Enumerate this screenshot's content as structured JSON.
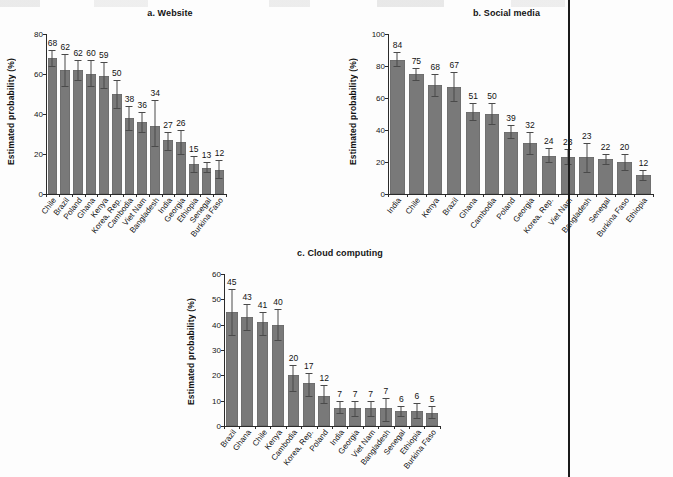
{
  "figure": {
    "ylabel": "Estimated probability (%)",
    "bar_color": "#797979",
    "error_color": "#4a4a4a",
    "axis_color": "#2b2b2b"
  },
  "chart_data": [
    {
      "type": "bar",
      "panel": "a",
      "title": "a. Website",
      "xlabel": "",
      "ylabel": "Estimated probability (%)",
      "ylim": [
        0,
        80
      ],
      "yticks": [
        0,
        20,
        40,
        60,
        80
      ],
      "grid": false,
      "legend": "none",
      "categories": [
        "Chile",
        "Brazil",
        "Poland",
        "Ghana",
        "Kenya",
        "Korea, Rep.",
        "Cambodia",
        "Viet Nam",
        "Bangladesh",
        "India",
        "Georgia",
        "Ethiopia",
        "Senegal",
        "Burkina Faso"
      ],
      "values": [
        68,
        62,
        62,
        60,
        59,
        50,
        38,
        36,
        34,
        27,
        26,
        15,
        13,
        12
      ],
      "labels": [
        "68",
        "62",
        "62",
        "60",
        "59",
        "50",
        "38",
        "36",
        "34",
        "27",
        "26",
        "15",
        "13",
        "12"
      ],
      "err_low": [
        64,
        54,
        57,
        54,
        53,
        43,
        32,
        31,
        24,
        22,
        20,
        11,
        11,
        8
      ],
      "err_high": [
        72,
        70,
        67,
        67,
        66,
        57,
        44,
        41,
        47,
        31,
        32,
        19,
        16,
        17
      ]
    },
    {
      "type": "bar",
      "panel": "b",
      "title": "b. Social media",
      "xlabel": "",
      "ylabel": "Estimated probability (%)",
      "ylim": [
        0,
        100
      ],
      "yticks": [
        0,
        20,
        40,
        60,
        80,
        100
      ],
      "grid": false,
      "legend": "none",
      "categories": [
        "India",
        "Chile",
        "Kenya",
        "Brazil",
        "Ghana",
        "Cambodia",
        "Poland",
        "Georgia",
        "Korea, Rep.",
        "Viet Nam",
        "Bangladesh",
        "Senegal",
        "Burkina Faso",
        "Ethiopia"
      ],
      "values": [
        84,
        75,
        68,
        67,
        51,
        50,
        39,
        32,
        24,
        23,
        23,
        22,
        20,
        12
      ],
      "labels": [
        "84",
        "75",
        "68",
        "67",
        "51",
        "50",
        "39",
        "32",
        "24",
        "23",
        "23",
        "22",
        "20",
        "12"
      ],
      "err_low": [
        80,
        71,
        61,
        58,
        46,
        44,
        35,
        25,
        20,
        19,
        14,
        19,
        15,
        9
      ],
      "err_high": [
        89,
        79,
        75,
        76,
        57,
        57,
        43,
        39,
        29,
        28,
        32,
        25,
        25,
        15
      ]
    },
    {
      "type": "bar",
      "panel": "c",
      "title": "c. Cloud computing",
      "xlabel": "",
      "ylabel": "Estimated probability (%)",
      "ylim": [
        0,
        60
      ],
      "yticks": [
        0,
        10,
        20,
        30,
        40,
        50,
        60
      ],
      "grid": false,
      "legend": "none",
      "categories": [
        "Brazil",
        "Ghana",
        "Chile",
        "Kenya",
        "Cambodia",
        "Korea, Rep.",
        "Poland",
        "India",
        "Georgia",
        "Viet Nam",
        "Bangladesh",
        "Senegal",
        "Ethiopia",
        "Burkina Faso"
      ],
      "values": [
        45,
        43,
        41,
        40,
        20,
        17,
        12,
        7,
        7,
        7,
        7,
        6,
        6,
        5
      ],
      "labels": [
        "45",
        "43",
        "41",
        "40",
        "20",
        "17",
        "12",
        "7",
        "7",
        "7",
        "7",
        "6",
        "6",
        "5"
      ],
      "err_low": [
        36,
        38,
        36,
        34,
        14,
        12,
        9,
        5,
        4,
        4,
        2,
        4,
        3,
        3
      ],
      "err_high": [
        54,
        48,
        45,
        46,
        24,
        21,
        16,
        10,
        10,
        10,
        11,
        8,
        9,
        8
      ]
    }
  ]
}
